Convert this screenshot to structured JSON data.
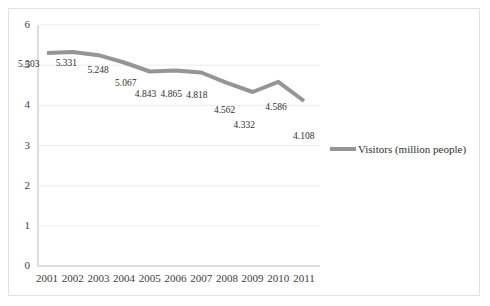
{
  "chart_data": {
    "type": "line",
    "title": "",
    "xlabel": "",
    "ylabel": "",
    "categories": [
      "2001",
      "2002",
      "2003",
      "2004",
      "2005",
      "2006",
      "2007",
      "2008",
      "2009",
      "2010",
      "2011"
    ],
    "series": [
      {
        "name": "Visitors (million people)",
        "values": [
          5.303,
          5.331,
          5.248,
          5.067,
          4.843,
          4.865,
          4.818,
          4.562,
          4.332,
          4.586,
          4.108
        ],
        "color": "#959595"
      }
    ],
    "data_labels": [
      "5.303",
      "5.331",
      "5.248",
      "5.067",
      "4.843",
      "4.865",
      "4.818",
      "4.562",
      "4.332",
      "4.586",
      "4.108"
    ],
    "ylim": [
      0,
      6
    ],
    "yticks": [
      "0",
      "1",
      "2",
      "3",
      "4",
      "5",
      "6"
    ],
    "grid": true,
    "legend_position": "right"
  },
  "legend": {
    "label": "Visitors (million people)"
  },
  "colors": {
    "line": "#959595",
    "grid": "#ececec",
    "axis": "#bdbdbd",
    "border": "#e2e2e2",
    "text": "#2f2f2f"
  }
}
